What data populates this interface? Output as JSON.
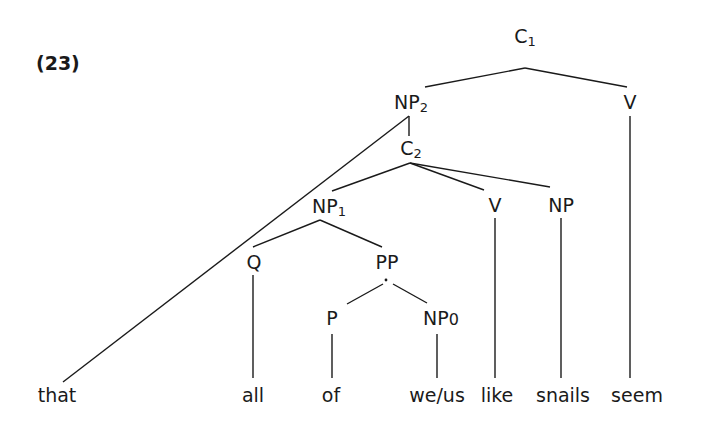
{
  "example_number": "(23)",
  "tree": {
    "nodes": {
      "C1": {
        "cat": "C",
        "sub": "1"
      },
      "NP2": {
        "cat": "NP",
        "sub": "2"
      },
      "V_top": {
        "cat": "V",
        "sub": ""
      },
      "C2": {
        "cat": "C",
        "sub": "2"
      },
      "NP1": {
        "cat": "NP",
        "sub": "1"
      },
      "V_mid": {
        "cat": "V",
        "sub": ""
      },
      "NP_mid": {
        "cat": "NP",
        "sub": ""
      },
      "Q": {
        "cat": "Q",
        "sub": ""
      },
      "PP": {
        "cat": "PP",
        "sub": ""
      },
      "P": {
        "cat": "P",
        "sub": ""
      },
      "NP0": {
        "cat": "NP",
        "sub": "0"
      }
    },
    "words": {
      "that": "that",
      "all": "all",
      "of": "of",
      "weus": "we/us",
      "like": "like",
      "snails": "snails",
      "seem": "seem"
    }
  }
}
